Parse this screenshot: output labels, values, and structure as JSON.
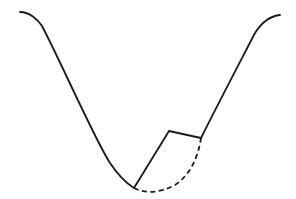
{
  "diagram": {
    "colors": {
      "stroke": "#1a1a1a",
      "background": "#ffffff"
    },
    "paths": {
      "main_curve": "M20,12 C30,12 38,20 42,26 C60,60 95,140 110,163 C118,175 126,183 134,188",
      "inner_polyline": "M134,188 L169,131 L201,138",
      "right_curve": "M201,138 C220,100 240,62 255,33 C262,22 270,16 280,15",
      "dashed_arc": "M134,188 C145,194 160,193 175,185 C190,175 198,158 201,138"
    }
  }
}
